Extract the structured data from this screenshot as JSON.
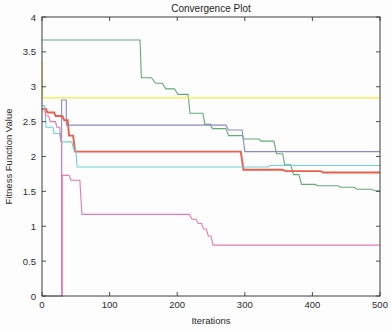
{
  "figure": {
    "background_color": "#fdfdfd",
    "axes_color": "#3c3c3c"
  },
  "chart_data": {
    "type": "line",
    "title": "Convergence Plot",
    "xlabel": "Iterations",
    "ylabel": "Fitness Function Value",
    "xlim": [
      0,
      500
    ],
    "ylim": [
      0,
      4
    ],
    "xticks": [
      0,
      100,
      200,
      300,
      400,
      500
    ],
    "xticklabels": [
      "0",
      "100",
      "200",
      "300",
      "400",
      "500"
    ],
    "yticks": [
      0,
      0.5,
      1,
      1.5,
      2,
      2.5,
      3,
      3.5,
      4
    ],
    "yticklabels": [
      "0",
      "0.5",
      "1",
      "1.5",
      "2",
      "2.5",
      "3",
      "3.5",
      "4"
    ],
    "grid": false,
    "legend": "none",
    "series": [
      {
        "name": "run-1-green",
        "color": "#66aa77",
        "width": 1.1,
        "final_value": 1.51,
        "points": [
          [
            0,
            3.67
          ],
          [
            145,
            3.67
          ],
          [
            147,
            3.13
          ],
          [
            162,
            3.13
          ],
          [
            168,
            3.05
          ],
          [
            178,
            3.05
          ],
          [
            183,
            2.97
          ],
          [
            196,
            2.97
          ],
          [
            201,
            2.89
          ],
          [
            216,
            2.89
          ],
          [
            219,
            2.62
          ],
          [
            238,
            2.62
          ],
          [
            241,
            2.46
          ],
          [
            249,
            2.46
          ],
          [
            252,
            2.4
          ],
          [
            272,
            2.4
          ],
          [
            276,
            2.3
          ],
          [
            296,
            2.3
          ],
          [
            299,
            2.25
          ],
          [
            321,
            2.25
          ],
          [
            324,
            2.22
          ],
          [
            343,
            2.22
          ],
          [
            347,
            2.04
          ],
          [
            356,
            2.04
          ],
          [
            359,
            1.88
          ],
          [
            368,
            1.88
          ],
          [
            372,
            1.74
          ],
          [
            380,
            1.74
          ],
          [
            384,
            1.6
          ],
          [
            404,
            1.6
          ],
          [
            408,
            1.58
          ],
          [
            438,
            1.58
          ],
          [
            442,
            1.56
          ],
          [
            462,
            1.56
          ],
          [
            466,
            1.53
          ],
          [
            488,
            1.53
          ],
          [
            492,
            1.51
          ],
          [
            500,
            1.51
          ]
        ]
      },
      {
        "name": "run-2-yellow",
        "color": "#f2ee48",
        "width": 1.1,
        "final_value": 2.84,
        "points": [
          [
            0,
            3.37
          ],
          [
            1,
            2.84
          ],
          [
            500,
            2.84
          ]
        ]
      },
      {
        "name": "run-3-purple",
        "color": "#8a8ac8",
        "width": 1.1,
        "final_value": 2.07,
        "points": [
          [
            0,
            0.0
          ],
          [
            29,
            0.0
          ],
          [
            29,
            2.81
          ],
          [
            36,
            2.81
          ],
          [
            36,
            2.45
          ],
          [
            50,
            2.45
          ],
          [
            50,
            2.45
          ],
          [
            272,
            2.45
          ],
          [
            276,
            2.38
          ],
          [
            296,
            2.38
          ],
          [
            300,
            2.07
          ],
          [
            500,
            2.07
          ]
        ]
      },
      {
        "name": "run-4-red",
        "color": "#e8604c",
        "width": 1.9,
        "final_value": 1.77,
        "points": [
          [
            0,
            2.68
          ],
          [
            6,
            2.68
          ],
          [
            8,
            2.63
          ],
          [
            18,
            2.63
          ],
          [
            20,
            2.58
          ],
          [
            30,
            2.58
          ],
          [
            33,
            2.52
          ],
          [
            38,
            2.52
          ],
          [
            40,
            2.3
          ],
          [
            46,
            2.3
          ],
          [
            49,
            2.07
          ],
          [
            294,
            2.07
          ],
          [
            298,
            1.81
          ],
          [
            356,
            1.81
          ],
          [
            360,
            1.79
          ],
          [
            412,
            1.79
          ],
          [
            416,
            1.77
          ],
          [
            500,
            1.77
          ]
        ]
      },
      {
        "name": "run-5-cyan",
        "color": "#6fcfd4",
        "width": 1.1,
        "final_value": 1.87,
        "points": [
          [
            0,
            2.73
          ],
          [
            4,
            2.73
          ],
          [
            6,
            2.42
          ],
          [
            16,
            2.42
          ],
          [
            18,
            2.33
          ],
          [
            26,
            2.33
          ],
          [
            28,
            2.21
          ],
          [
            44,
            2.21
          ],
          [
            47,
            2.1
          ],
          [
            50,
            2.1
          ],
          [
            52,
            1.85
          ],
          [
            334,
            1.85
          ],
          [
            338,
            1.87
          ],
          [
            500,
            1.87
          ]
        ]
      },
      {
        "name": "run-6-magenta",
        "color": "#e87ab0",
        "width": 1.1,
        "final_value": 0.73,
        "points": [
          [
            0,
            2.67
          ],
          [
            4,
            2.67
          ],
          [
            6,
            2.58
          ],
          [
            10,
            2.58
          ],
          [
            12,
            2.5
          ],
          [
            20,
            2.5
          ],
          [
            22,
            2.42
          ],
          [
            26,
            2.42
          ],
          [
            28,
            2.23
          ],
          [
            29,
            2.23
          ],
          [
            29,
            0.0
          ],
          [
            30,
            0.0
          ],
          [
            30,
            1.73
          ],
          [
            40,
            1.73
          ],
          [
            43,
            1.66
          ],
          [
            56,
            1.66
          ],
          [
            59,
            1.17
          ],
          [
            218,
            1.17
          ],
          [
            222,
            1.1
          ],
          [
            228,
            1.1
          ],
          [
            231,
            1.04
          ],
          [
            236,
            1.04
          ],
          [
            239,
            0.96
          ],
          [
            243,
            0.96
          ],
          [
            246,
            0.86
          ],
          [
            250,
            0.86
          ],
          [
            253,
            0.73
          ],
          [
            500,
            0.73
          ]
        ]
      }
    ]
  }
}
